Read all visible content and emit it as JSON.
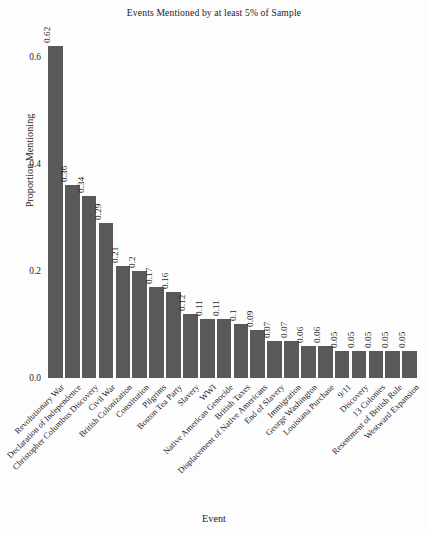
{
  "chart_data": {
    "type": "bar",
    "title": "Events Mentioned by at least 5% of Sample",
    "xlabel": "Event",
    "ylabel": "Proportion Mentioning",
    "ylim": [
      0,
      0.65
    ],
    "grid": false,
    "legend": null,
    "bar_color": "#595959",
    "background_color": "#fdfdfd",
    "y_ticks": [
      "0.0",
      "0.2",
      "0.4",
      "0.6"
    ],
    "y_tick_values": [
      0.0,
      0.2,
      0.4,
      0.6
    ],
    "categories": [
      "Revolutionary War",
      "Declaration of Independence",
      "Christopher Columbus Discovery",
      "Civil War",
      "British Colonization",
      "Constitution",
      "Pilgrims",
      "Boston Tea Party",
      "Slavery",
      "WWI",
      "Native American Genocide",
      "British Taxes",
      "Displacement of Native Americans",
      "End of Slavery",
      "Immigration",
      "George Washington",
      "Louisiana Purchase",
      "9/11",
      "Discovery",
      "13 Colonies",
      "Resentment of British Rule",
      "Westward Expansion"
    ],
    "values": [
      0.62,
      0.36,
      0.34,
      0.29,
      0.21,
      0.2,
      0.17,
      0.16,
      0.12,
      0.11,
      0.11,
      0.1,
      0.09,
      0.07,
      0.07,
      0.06,
      0.06,
      0.05,
      0.05,
      0.05,
      0.05,
      0.05
    ],
    "value_labels": [
      "0.62",
      "0.36",
      "0.34",
      "0.29",
      "0.21",
      "0.2",
      "0.17",
      "0.16",
      "0.12",
      "0.11",
      "0.11",
      "0.1",
      "0.09",
      "0.07",
      "0.07",
      "0.06",
      "0.06",
      "0.05",
      "0.05",
      "0.05",
      "0.05",
      "0.05"
    ]
  }
}
